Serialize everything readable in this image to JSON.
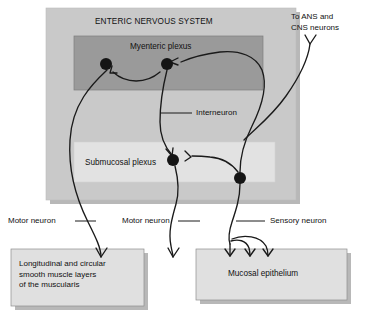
{
  "diagram": {
    "title": "ENTERIC NERVOUS SYSTEM",
    "regions": {
      "enteric_nervous_system": {
        "label": "ENTERIC NERVOUS SYSTEM",
        "fill": "#c9c9c9"
      },
      "myenteric_plexus": {
        "label": "Myenteric plexus",
        "fill": "#9a9a9a"
      },
      "submucosal_plexus": {
        "label": "Submucosal plexus",
        "fill": "#e2e2e2"
      },
      "muscularis_box": {
        "label": "Longitudinal and circular\nsmooth muscle layers\nof the muscularis",
        "fill": "#e0e0e0"
      },
      "mucosal_epithelium_box": {
        "label": "Mucosal epithelium",
        "fill": "#e0e0e0"
      }
    },
    "annotations": {
      "to_ans_cns": "To ANS and\nCNS neurons",
      "interneuron": "Interneuron",
      "motor_neuron_left": "Motor neuron",
      "motor_neuron_middle": "Motor neuron",
      "sensory_neuron": "Sensory neuron"
    },
    "colors": {
      "outer_fill": "#c9c9c9",
      "myenteric_fill": "#9a9a9a",
      "submucosal_fill": "#e2e2e2",
      "endbox_fill": "#e0e0e0",
      "stroke": "#1a1a1a",
      "shadow": "#b8b8b8",
      "text": "#111111"
    },
    "soma_count": 4,
    "sensory_terminal_branches": 3
  }
}
